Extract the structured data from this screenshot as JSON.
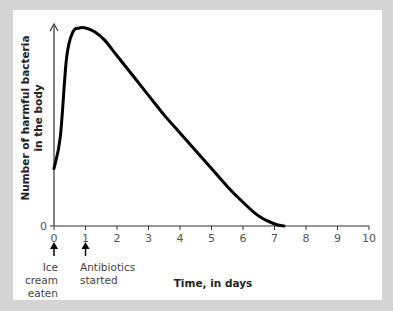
{
  "chart_data": {
    "type": "line",
    "title": "",
    "xlabel": "Time, in days",
    "ylabel_line1": "Number of harmful bacteria",
    "ylabel_line2": "in the body",
    "x_ticks": [
      "0",
      "1",
      "2",
      "3",
      "4",
      "5",
      "6",
      "7",
      "8",
      "9",
      "10"
    ],
    "y_ticks": [
      "0"
    ],
    "xlim": [
      0,
      10
    ],
    "ylim": [
      0,
      100
    ],
    "grid": false,
    "legend": null,
    "series": [
      {
        "name": "Harmful bacteria",
        "x": [
          0,
          0.2,
          0.4,
          0.6,
          0.8,
          1.0,
          1.3,
          1.6,
          2.0,
          2.5,
          3.0,
          3.5,
          4.0,
          4.5,
          5.0,
          5.5,
          6.0,
          6.5,
          7.0,
          7.3,
          10
        ],
        "values": [
          29,
          45,
          85,
          98,
          100,
          100,
          98,
          94,
          86,
          76,
          66,
          56,
          47,
          38,
          29,
          20,
          12,
          5,
          1,
          0,
          0
        ]
      }
    ],
    "annotations": [
      {
        "x": 0,
        "label_lines": [
          "Ice",
          "cream",
          "eaten"
        ]
      },
      {
        "x": 1,
        "label_lines": [
          "Antibiotics",
          "started"
        ]
      }
    ],
    "colors": {
      "line": "#000000",
      "background": "#d4d4d4",
      "panel": "#ffffff"
    }
  }
}
